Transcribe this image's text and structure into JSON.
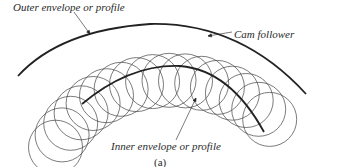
{
  "figure": {
    "caption": "(a)",
    "labels": {
      "outer": "Outer envelope or profile",
      "inner": "Inner envelope or profile",
      "follower": "Cam follower"
    },
    "colors": {
      "stroke": "#222222",
      "circle": "#444444",
      "text": "#2a2a2a",
      "background": "#ffffff"
    },
    "follower_circles": {
      "count": 17,
      "radius": 27,
      "path_center": [
        172,
        182
      ],
      "path_radius": 124,
      "start_angle_deg": 200,
      "end_angle_deg": 322
    },
    "envelopes": {
      "outer": "M 18 76 Q 60 30 150 24 Q 240 22 306 94",
      "inner": "M 82 104 Q 130 64 180 66 Q 230 70 264 132"
    },
    "leaders": {
      "outer": [
        [
          74,
          12
        ],
        [
          90,
          34
        ]
      ],
      "follower": [
        [
          232,
          32
        ],
        [
          208,
          36
        ]
      ],
      "inner": [
        [
          176,
          140
        ],
        [
          196,
          98
        ]
      ]
    }
  }
}
